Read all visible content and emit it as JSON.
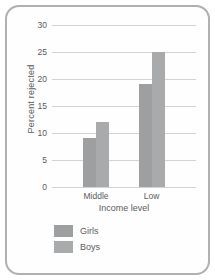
{
  "chart_data": {
    "type": "bar",
    "categories": [
      "Middle",
      "Low"
    ],
    "series": [
      {
        "name": "Girls",
        "values": [
          9,
          19
        ],
        "color": "#9d9fa0"
      },
      {
        "name": "Boys",
        "values": [
          12,
          25
        ],
        "color": "#a8aaab"
      }
    ],
    "title": "",
    "xlabel": "Income level",
    "ylabel": "Percent rejected",
    "ylim": [
      0,
      30
    ],
    "yticks": [
      0,
      5,
      10,
      15,
      20,
      25,
      30
    ],
    "grid": true,
    "legend_position": "bottom-left",
    "legend": [
      {
        "label": "Girls",
        "swatch_color": "#9d9fa0"
      },
      {
        "label": "Boys",
        "swatch_color": "#a8aaab"
      }
    ]
  },
  "colors": {
    "card_border": "#b0b0b0",
    "card_background": "#fefefe",
    "gridline": "#d3d3d3",
    "text": "#5a5a5a"
  }
}
